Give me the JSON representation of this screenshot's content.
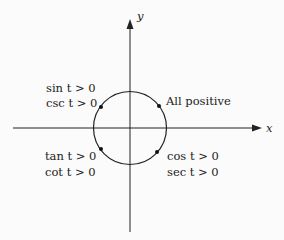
{
  "axes": {
    "x_label": "x",
    "y_label": "y"
  },
  "quadrants": {
    "q1": {
      "lines": [
        "All positive"
      ]
    },
    "q2": {
      "lines": [
        "sin t > 0",
        "csc t > 0"
      ]
    },
    "q3": {
      "lines": [
        "tan t > 0",
        "cot t > 0"
      ]
    },
    "q4": {
      "lines": [
        "cos t > 0",
        "sec t > 0"
      ]
    }
  },
  "colors": {
    "line": "#222222",
    "background": "#fbfbfb"
  }
}
